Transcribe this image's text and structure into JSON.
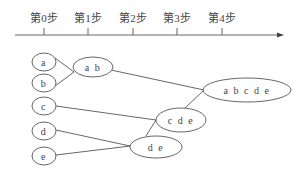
{
  "axis": {
    "steps": [
      {
        "label": "第0步",
        "x": 44
      },
      {
        "label": "第1步",
        "x": 88
      },
      {
        "label": "第2步",
        "x": 133
      },
      {
        "label": "第3步",
        "x": 177
      },
      {
        "label": "第4步",
        "x": 222
      }
    ]
  },
  "nodes": {
    "a": {
      "label": "a"
    },
    "b": {
      "label": "b"
    },
    "c": {
      "label": "c"
    },
    "d": {
      "label": "d"
    },
    "e": {
      "label": "e"
    },
    "ab": {
      "label": "a b"
    },
    "de": {
      "label": "d e"
    },
    "cde": {
      "label": "c d e"
    },
    "abcde": {
      "label": "a b c d e"
    }
  },
  "colors": {
    "stroke": "#555555",
    "text": "#444444",
    "background": "#ffffff"
  }
}
